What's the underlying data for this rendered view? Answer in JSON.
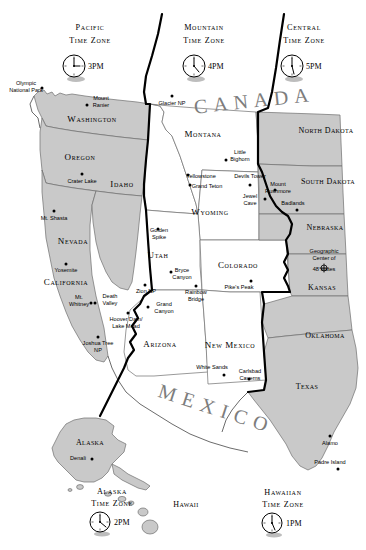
{
  "map": {
    "title": "United States Time Zones Map",
    "country_labels": [
      {
        "name": "canada",
        "text": "C A N A D A"
      },
      {
        "name": "mexico",
        "text": "M E X I C O"
      }
    ],
    "time_zones": [
      {
        "id": "pacific",
        "title_line1": "Pacific",
        "title_line2": "Time Zone",
        "hour": "3",
        "meridiem": "PM",
        "label": "3PM"
      },
      {
        "id": "mountain",
        "title_line1": "Mountain",
        "title_line2": "Time Zone",
        "hour": "4",
        "meridiem": "PM",
        "label": "4PM"
      },
      {
        "id": "central",
        "title_line1": "Central",
        "title_line2": "Time Zone",
        "hour": "5",
        "meridiem": "PM",
        "label": "5PM"
      },
      {
        "id": "alaska",
        "title_line1": "Alaska",
        "title_line2": "Time Zone",
        "hour": "2",
        "meridiem": "PM",
        "label": "2PM"
      },
      {
        "id": "hawaiian",
        "title_line1": "Hawaiian",
        "title_line2": "Time Zone",
        "hour": "1",
        "meridiem": "PM",
        "label": "1PM"
      }
    ],
    "states": [
      {
        "id": "washington",
        "label": "Washington",
        "shaded": true
      },
      {
        "id": "oregon",
        "label": "Oregon",
        "shaded": true
      },
      {
        "id": "california",
        "label": "California",
        "shaded": true
      },
      {
        "id": "nevada",
        "label": "Nevada",
        "shaded": true
      },
      {
        "id": "idaho",
        "label": "Idaho",
        "shaded": false
      },
      {
        "id": "montana",
        "label": "Montana",
        "shaded": false
      },
      {
        "id": "wyoming",
        "label": "Wyoming",
        "shaded": false
      },
      {
        "id": "utah",
        "label": "Utah",
        "shaded": false
      },
      {
        "id": "arizona",
        "label": "Arizona",
        "shaded": false
      },
      {
        "id": "colorado",
        "label": "Colorado",
        "shaded": false
      },
      {
        "id": "new-mexico",
        "label": "New Mexico",
        "shaded": false
      },
      {
        "id": "north-dakota",
        "label": "North Dakota",
        "shaded": true
      },
      {
        "id": "south-dakota",
        "label": "South Dakota",
        "shaded": true
      },
      {
        "id": "nebraska",
        "label": "Nebraska",
        "shaded": true
      },
      {
        "id": "kansas",
        "label": "Kansas",
        "shaded": true
      },
      {
        "id": "oklahoma",
        "label": "Oklahoma",
        "shaded": true
      },
      {
        "id": "texas",
        "label": "Texas",
        "shaded": true
      },
      {
        "id": "alaska",
        "label": "Alaska",
        "shaded": true
      },
      {
        "id": "hawaii",
        "label": "Hawaii",
        "shaded": true
      }
    ],
    "points_of_interest": [
      {
        "id": "olympic-national-park",
        "label": "Olympic\nNational Park",
        "line1": "Olympic",
        "line2": "National Park"
      },
      {
        "id": "mount-ranier",
        "label": "Mount\nRanier",
        "line1": "Mount",
        "line2": "Ranier"
      },
      {
        "id": "glacier-np",
        "label": "Glacier NP",
        "line1": "Glacier NP",
        "line2": ""
      },
      {
        "id": "crater-lake",
        "label": "Crater Lake",
        "line1": "Crater Lake",
        "line2": ""
      },
      {
        "id": "little-bighorn",
        "label": "Little\nBighorn",
        "line1": "Little",
        "line2": "Bighorn"
      },
      {
        "id": "yellowstone",
        "label": "Yellowstone",
        "line1": "Yellowstone",
        "line2": ""
      },
      {
        "id": "grand-teton",
        "label": "Grand Teton",
        "line1": "Grand Teton",
        "line2": ""
      },
      {
        "id": "devils-tower",
        "label": "Devils Tower",
        "line1": "Devils Tower",
        "line2": ""
      },
      {
        "id": "mount-rushmore",
        "label": "Mount\nRushmore",
        "line1": "Mount",
        "line2": "Rushmore"
      },
      {
        "id": "jewel-cave",
        "label": "Jewel\nCave",
        "line1": "Jewel",
        "line2": "Cave"
      },
      {
        "id": "badlands",
        "label": "Badlands",
        "line1": "Badlands",
        "line2": ""
      },
      {
        "id": "mt-shasta",
        "label": "Mt. Shasta",
        "line1": "Mt. Shasta",
        "line2": ""
      },
      {
        "id": "golden-spike",
        "label": "Golden\nSpike",
        "line1": "Golden",
        "line2": "Spike"
      },
      {
        "id": "yosemite",
        "label": "Yosemite",
        "line1": "Yosemite",
        "line2": ""
      },
      {
        "id": "bryce-canyon",
        "label": "Bryce\nCanyon",
        "line1": "Bryce",
        "line2": "Canyon"
      },
      {
        "id": "zion-np",
        "label": "Zion NP",
        "line1": "Zion NP",
        "line2": ""
      },
      {
        "id": "rainbow-bridge",
        "label": "Rainbow\nBridge",
        "line1": "Rainbow",
        "line2": "Bridge"
      },
      {
        "id": "geographic-center",
        "label": "Geographic\nCenter of\n48 states",
        "line1": "Geographic",
        "line2": "Center of",
        "line3": "48 states"
      },
      {
        "id": "mt-whitney",
        "label": "Mt.\nWhitney",
        "line1": "Mt.",
        "line2": "Whitney"
      },
      {
        "id": "death-valley",
        "label": "Death\nValley",
        "line1": "Death",
        "line2": "Valley"
      },
      {
        "id": "grand-canyon",
        "label": "Grand\nCanyon",
        "line1": "Grand",
        "line2": "Canyon"
      },
      {
        "id": "pikes-peak",
        "label": "Pike's Peak",
        "line1": "Pike's Peak",
        "line2": ""
      },
      {
        "id": "hoover-dam-lake-mead",
        "label": "Hoover Dam/\nLake Mead",
        "line1": "Hoover Dam/",
        "line2": "Lake Mead"
      },
      {
        "id": "joshua-tree-np",
        "label": "Joshua Tree\nNP",
        "line1": "Joshua Tree",
        "line2": "NP"
      },
      {
        "id": "white-sands",
        "label": "White Sands",
        "line1": "White Sands",
        "line2": ""
      },
      {
        "id": "carlsbad-caverns",
        "label": "Carlsbad\nCaverns",
        "line1": "Carlsbad",
        "line2": "Caverns"
      },
      {
        "id": "alamo",
        "label": "Alamo",
        "line1": "Alamo",
        "line2": ""
      },
      {
        "id": "padre-island",
        "label": "Padre Island",
        "line1": "Padre Island",
        "line2": ""
      },
      {
        "id": "denali",
        "label": "Denali",
        "line1": "Denali",
        "line2": ""
      }
    ],
    "colors": {
      "shaded_state_fill": "#c9c9c9",
      "plain_state_fill": "#ffffff",
      "border": "#6e6e6e",
      "timezone_line": "#000000",
      "country_text": "#7d7d7d",
      "background": "#ffffff"
    }
  }
}
